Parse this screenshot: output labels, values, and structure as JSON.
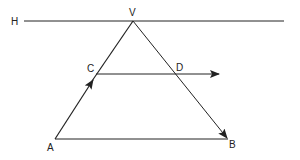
{
  "diagram": {
    "stroke_color": "#222222",
    "background": "#ffffff",
    "labels": {
      "H": "H",
      "V": "V",
      "C": "C",
      "D": "D",
      "A": "A",
      "B": "B"
    },
    "points": {
      "H_start": [
        24,
        21
      ],
      "H_end": [
        284,
        21
      ],
      "V": [
        133,
        21
      ],
      "A": [
        55,
        139
      ],
      "B": [
        228,
        139
      ],
      "C": [
        96,
        74
      ],
      "D": [
        175,
        74
      ],
      "CD_end": [
        220,
        74
      ]
    },
    "arrows": [
      {
        "name": "arrow-A-to-V",
        "on": "AV",
        "direction": "toward V"
      },
      {
        "name": "arrow-V-to-B",
        "on": "VB",
        "direction": "toward B"
      },
      {
        "name": "arrow-C-through-D",
        "on": "CD",
        "direction": "rightward"
      }
    ]
  }
}
